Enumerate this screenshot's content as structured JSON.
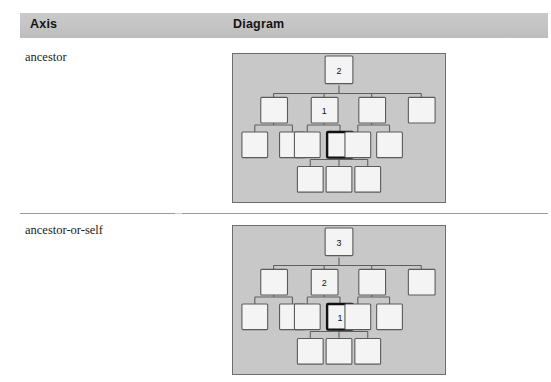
{
  "table": {
    "headers": {
      "axis": "Axis",
      "diagram": "Diagram"
    },
    "rows": [
      {
        "axis_label": "ancestor",
        "diagram": {
          "background_color": "#c8c8c8",
          "border_color": "#6e6e6e",
          "node_fill": "#f4f4f4",
          "node_stroke": "#5a5a5a",
          "highlight_stroke": "#111111",
          "nodes": [
            {
              "id": "root",
              "x": 107,
              "y": 16,
              "label": "2",
              "highlight": false
            },
            {
              "id": "a1",
              "x": 41,
              "y": 48,
              "label": "",
              "highlight": false
            },
            {
              "id": "a2",
              "x": 92,
              "y": 48,
              "label": "1",
              "highlight": false
            },
            {
              "id": "a3",
              "x": 140,
              "y": 48,
              "label": "",
              "highlight": false
            },
            {
              "id": "a4",
              "x": 190,
              "y": 48,
              "label": "",
              "highlight": false
            },
            {
              "id": "b1",
              "x": 22,
              "y": 83,
              "label": "",
              "highlight": false
            },
            {
              "id": "b2",
              "x": 60,
              "y": 83,
              "label": "",
              "highlight": false
            },
            {
              "id": "b3",
              "x": 75,
              "y": 83,
              "label": "",
              "highlight": false
            },
            {
              "id": "b4",
              "x": 108,
              "y": 83,
              "label": "",
              "highlight": true
            },
            {
              "id": "b5",
              "x": 126,
              "y": 83,
              "label": "",
              "highlight": false
            },
            {
              "id": "b6",
              "x": 158,
              "y": 83,
              "label": "",
              "highlight": false
            },
            {
              "id": "c1",
              "x": 78,
              "y": 118,
              "label": "",
              "highlight": false
            },
            {
              "id": "c2",
              "x": 107,
              "y": 118,
              "label": "",
              "highlight": false
            },
            {
              "id": "c3",
              "x": 136,
              "y": 118,
              "label": "",
              "highlight": false
            }
          ]
        }
      },
      {
        "axis_label": "ancestor-or-self",
        "diagram": {
          "background_color": "#c8c8c8",
          "border_color": "#6e6e6e",
          "node_fill": "#f4f4f4",
          "node_stroke": "#5a5a5a",
          "highlight_stroke": "#111111",
          "nodes": [
            {
              "id": "root",
              "x": 107,
              "y": 16,
              "label": "3",
              "highlight": false
            },
            {
              "id": "a1",
              "x": 41,
              "y": 48,
              "label": "",
              "highlight": false
            },
            {
              "id": "a2",
              "x": 92,
              "y": 48,
              "label": "2",
              "highlight": false
            },
            {
              "id": "a3",
              "x": 140,
              "y": 48,
              "label": "",
              "highlight": false
            },
            {
              "id": "a4",
              "x": 190,
              "y": 48,
              "label": "",
              "highlight": false
            },
            {
              "id": "b1",
              "x": 22,
              "y": 83,
              "label": "",
              "highlight": false
            },
            {
              "id": "b2",
              "x": 60,
              "y": 83,
              "label": "",
              "highlight": false
            },
            {
              "id": "b3",
              "x": 75,
              "y": 83,
              "label": "",
              "highlight": false
            },
            {
              "id": "b4",
              "x": 108,
              "y": 83,
              "label": "1",
              "highlight": true
            },
            {
              "id": "b5",
              "x": 126,
              "y": 83,
              "label": "",
              "highlight": false
            },
            {
              "id": "b6",
              "x": 158,
              "y": 83,
              "label": "",
              "highlight": false
            },
            {
              "id": "c1",
              "x": 78,
              "y": 118,
              "label": "",
              "highlight": false
            },
            {
              "id": "c2",
              "x": 107,
              "y": 118,
              "label": "",
              "highlight": false
            },
            {
              "id": "c3",
              "x": 136,
              "y": 118,
              "label": "",
              "highlight": false
            }
          ]
        }
      }
    ]
  }
}
